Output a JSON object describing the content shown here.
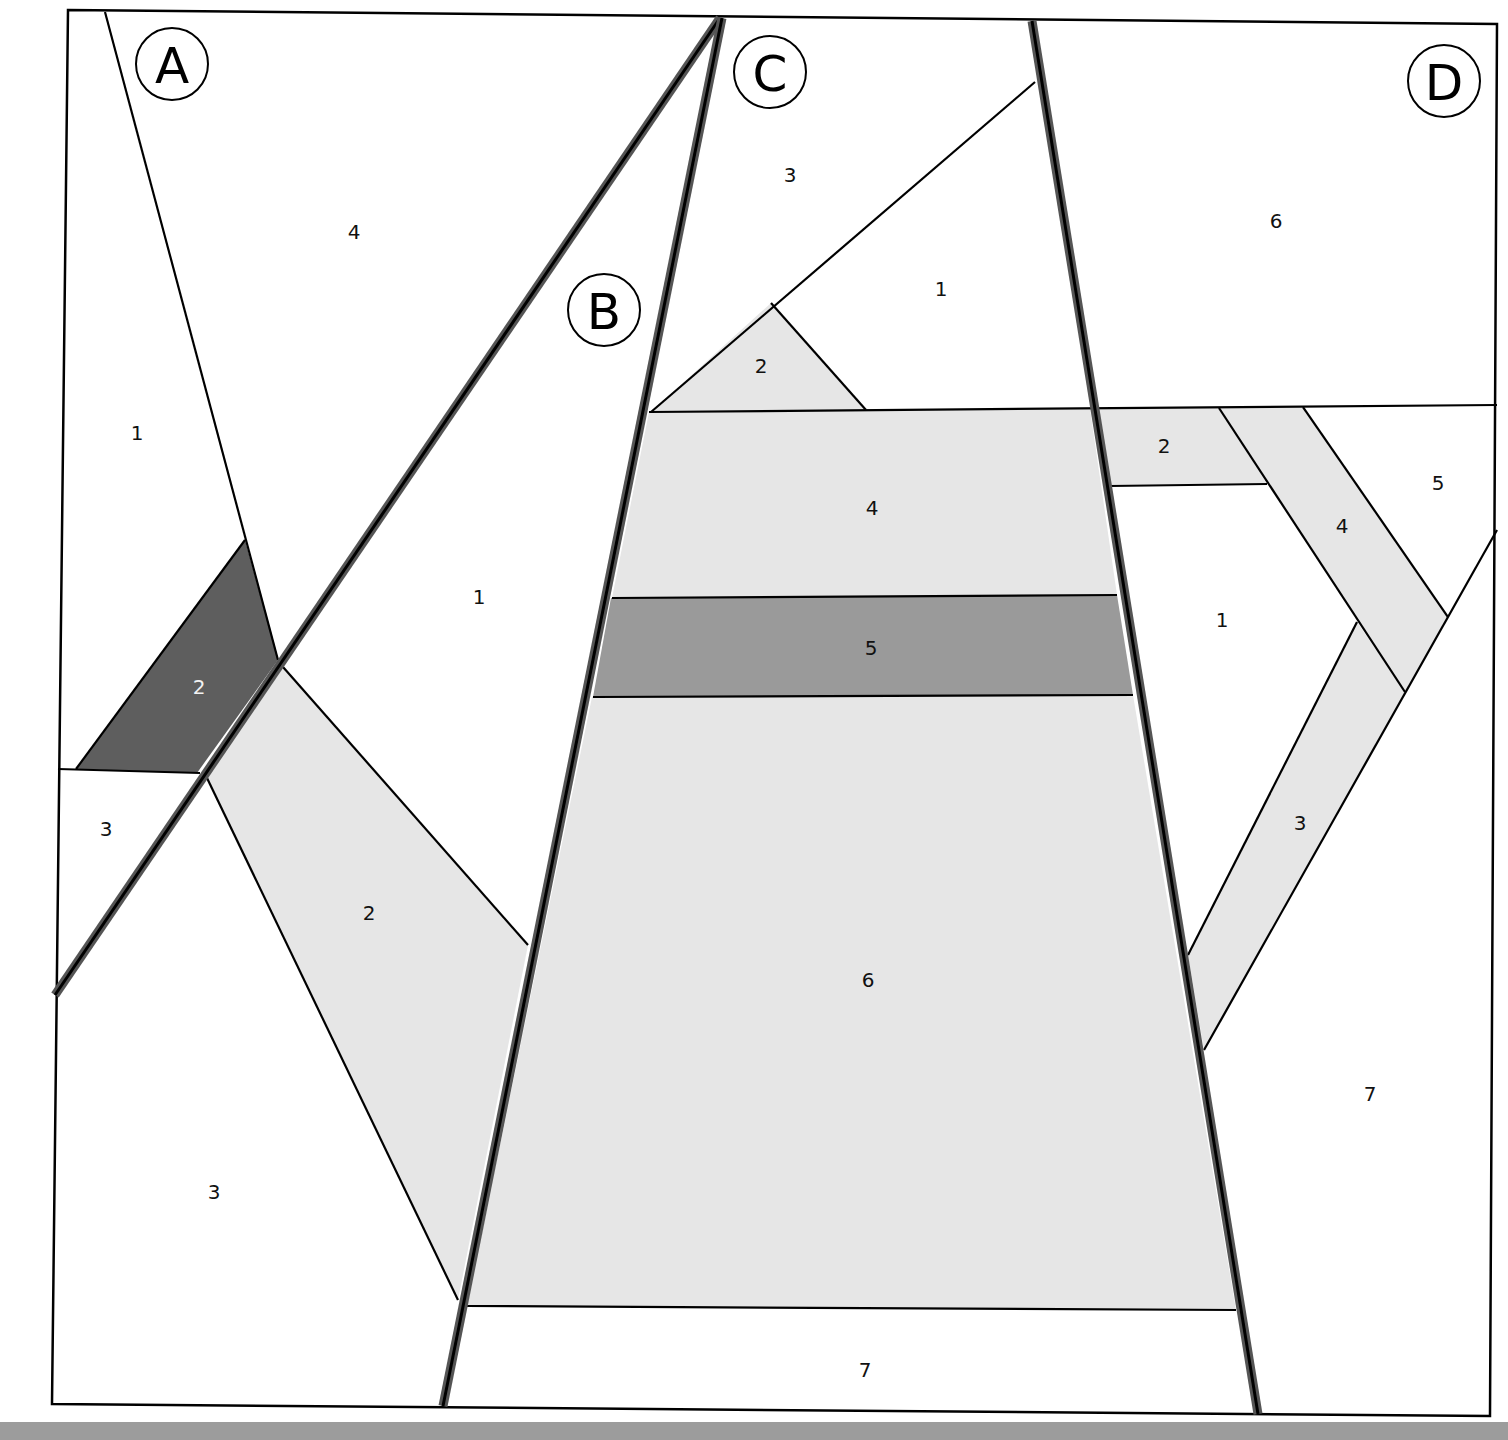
{
  "diagram": {
    "type": "quilt-paper-piecing-pattern",
    "colors": {
      "background": "#ffffff",
      "light_fabric": "#e6e6e6",
      "medium_fabric": "#9a9a9a",
      "dark_fabric": "#5e5e5e",
      "outline": "#000000",
      "section_seam": "#555555",
      "bottom_strip": "#9c9c9c"
    },
    "sections": [
      {
        "id": "A",
        "label": "A",
        "pieces": [
          {
            "number": "1",
            "fill": "white"
          },
          {
            "number": "2",
            "fill": "dark"
          },
          {
            "number": "3",
            "fill": "white"
          },
          {
            "number": "4",
            "fill": "white"
          }
        ]
      },
      {
        "id": "B",
        "label": "B",
        "pieces": [
          {
            "number": "1",
            "fill": "white"
          },
          {
            "number": "2",
            "fill": "light"
          },
          {
            "number": "3",
            "fill": "white"
          }
        ]
      },
      {
        "id": "C",
        "label": "C",
        "pieces": [
          {
            "number": "1",
            "fill": "white"
          },
          {
            "number": "2",
            "fill": "light"
          },
          {
            "number": "3",
            "fill": "white"
          },
          {
            "number": "4",
            "fill": "light"
          },
          {
            "number": "5",
            "fill": "medium"
          },
          {
            "number": "6",
            "fill": "light"
          },
          {
            "number": "7",
            "fill": "white"
          }
        ]
      },
      {
        "id": "D",
        "label": "D",
        "pieces": [
          {
            "number": "1",
            "fill": "white"
          },
          {
            "number": "2",
            "fill": "light"
          },
          {
            "number": "3",
            "fill": "light"
          },
          {
            "number": "4",
            "fill": "light"
          },
          {
            "number": "5",
            "fill": "white"
          },
          {
            "number": "6",
            "fill": "white"
          },
          {
            "number": "7",
            "fill": "white"
          }
        ]
      }
    ]
  }
}
